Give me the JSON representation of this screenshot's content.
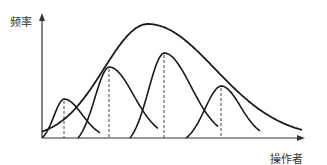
{
  "chart_data": {
    "type": "line",
    "title": "",
    "xlabel": "操作者",
    "ylabel": "频率",
    "grid": false,
    "legend": null,
    "envelope": {
      "name": "总体分布",
      "peak_x": 148,
      "peak_y": 24,
      "start_x": 42,
      "end_x": 302
    },
    "series": [
      {
        "name": "操作者1",
        "peak_x": 64,
        "peak_y": 99,
        "start_x": 42,
        "end_x": 100
      },
      {
        "name": "操作者2",
        "peak_x": 109,
        "peak_y": 67,
        "start_x": 78,
        "end_x": 158
      },
      {
        "name": "操作者3",
        "peak_x": 164,
        "peak_y": 53,
        "start_x": 130,
        "end_x": 218
      },
      {
        "name": "操作者4",
        "peak_x": 221,
        "peak_y": 86,
        "start_x": 186,
        "end_x": 260
      }
    ],
    "axes": {
      "origin": [
        42,
        138
      ],
      "x_end": 305,
      "y_end": 13
    },
    "colors": {
      "line": "#1a1a1a",
      "dash": "#444444"
    }
  }
}
